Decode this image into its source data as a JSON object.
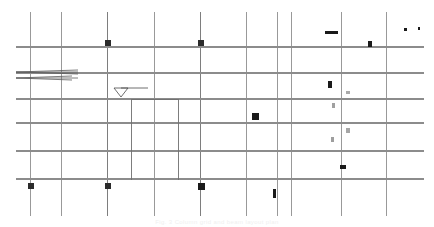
{
  "drawing": {
    "title": "Structural Framing Plan",
    "caption": "Fig. 3  Column grid and beam layout plan",
    "background_color": "#ffffff",
    "grid_line_color": "#9a9a9a",
    "beam_line_color": "#8c8c8c",
    "marker_color": "#1a1a1a",
    "faint_marker_color": "#a8a8a8",
    "annotation_color": "#4a4a4a",
    "caption_color": "#efefef",
    "canvas": {
      "width": 434,
      "height": 227
    }
  },
  "grid": {
    "vertical_label": "Column grid lines (vertical)",
    "horizontal_label": "Beam grid lines (horizontal)",
    "vertical_lines": [
      {
        "id": "V1",
        "x": 30,
        "y1": 12,
        "y2": 216,
        "weight": 0.9,
        "color": "#8e8e8e"
      },
      {
        "id": "V2",
        "x": 61,
        "y1": 12,
        "y2": 216,
        "weight": 0.9,
        "color": "#8e8e8e"
      },
      {
        "id": "V3",
        "x": 107,
        "y1": 12,
        "y2": 216,
        "weight": 1.0,
        "color": "#7e7e7e"
      },
      {
        "id": "V4",
        "x": 154,
        "y1": 12,
        "y2": 216,
        "weight": 0.9,
        "color": "#8e8e8e"
      },
      {
        "id": "V5",
        "x": 200,
        "y1": 12,
        "y2": 216,
        "weight": 1.0,
        "color": "#7e7e7e"
      },
      {
        "id": "V6",
        "x": 246,
        "y1": 12,
        "y2": 216,
        "weight": 0.9,
        "color": "#8e8e8e"
      },
      {
        "id": "V7",
        "x": 277,
        "y1": 12,
        "y2": 216,
        "weight": 0.9,
        "color": "#8e8e8e"
      },
      {
        "id": "V8",
        "x": 291,
        "y1": 12,
        "y2": 216,
        "weight": 0.9,
        "color": "#8e8e8e"
      },
      {
        "id": "V9",
        "x": 341,
        "y1": 12,
        "y2": 216,
        "weight": 0.9,
        "color": "#8e8e8e"
      },
      {
        "id": "V10",
        "x": 386,
        "y1": 12,
        "y2": 216,
        "weight": 0.9,
        "color": "#8e8e8e"
      }
    ],
    "horizontal_lines": [
      {
        "id": "H1",
        "y": 47,
        "x1": 16,
        "x2": 424,
        "weight": 1.1,
        "color": "#8c8c8c"
      },
      {
        "id": "H2",
        "y": 73,
        "x1": 16,
        "x2": 424,
        "weight": 1.1,
        "color": "#8c8c8c"
      },
      {
        "id": "H3",
        "y": 99,
        "x1": 16,
        "x2": 424,
        "weight": 1.1,
        "color": "#8c8c8c"
      },
      {
        "id": "H4",
        "y": 123,
        "x1": 16,
        "x2": 424,
        "weight": 1.1,
        "color": "#8c8c8c"
      },
      {
        "id": "H5",
        "y": 151,
        "x1": 16,
        "x2": 424,
        "weight": 1.1,
        "color": "#8c8c8c"
      },
      {
        "id": "H6",
        "y": 179,
        "x1": 16,
        "x2": 424,
        "weight": 1.3,
        "color": "#8c8c8c"
      }
    ],
    "interior_lines": [
      {
        "id": "I1",
        "x": 131,
        "y1": 100,
        "y2": 180,
        "weight": 0.9,
        "color": "#6f6f6f"
      },
      {
        "id": "I2",
        "x": 178,
        "y1": 99,
        "y2": 180,
        "weight": 0.9,
        "color": "#6f6f6f"
      },
      {
        "id": "I3",
        "y": 99,
        "x1": 131,
        "x2": 178,
        "weight": 0.9,
        "color": "#6f6f6f"
      }
    ]
  },
  "markers": {
    "label": "Column / detail markers",
    "squares": [
      {
        "id": "M1",
        "x": 105,
        "y": 40,
        "w": 6,
        "h": 6,
        "fill": "#2b2b2b",
        "kind": "column-marker"
      },
      {
        "id": "M2",
        "x": 198,
        "y": 40,
        "w": 6,
        "h": 6,
        "fill": "#2b2b2b",
        "kind": "column-marker"
      },
      {
        "id": "M3",
        "x": 368,
        "y": 41,
        "w": 4,
        "h": 6,
        "fill": "#1a1a1a",
        "kind": "detail-tag"
      },
      {
        "id": "M4",
        "x": 404,
        "y": 28,
        "w": 3,
        "h": 3,
        "fill": "#1a1a1a",
        "kind": "detail-tag"
      },
      {
        "id": "M5",
        "x": 418,
        "y": 27,
        "w": 2,
        "h": 3,
        "fill": "#1a1a1a",
        "kind": "detail-tag"
      },
      {
        "id": "M6",
        "x": 328,
        "y": 81,
        "w": 4,
        "h": 7,
        "fill": "#1a1a1a",
        "kind": "detail-tag"
      },
      {
        "id": "M7",
        "x": 346,
        "y": 91,
        "w": 4,
        "h": 3,
        "fill": "#aaaaaa",
        "kind": "faint-tag"
      },
      {
        "id": "M8",
        "x": 332,
        "y": 103,
        "w": 3,
        "h": 5,
        "fill": "#a0a0a0",
        "kind": "faint-tag"
      },
      {
        "id": "M9",
        "x": 252,
        "y": 113,
        "w": 7,
        "h": 7,
        "fill": "#1a1a1a",
        "kind": "column-marker"
      },
      {
        "id": "M10",
        "x": 346,
        "y": 128,
        "w": 4,
        "h": 5,
        "fill": "#a6a6a6",
        "kind": "faint-tag"
      },
      {
        "id": "M11",
        "x": 331,
        "y": 137,
        "w": 3,
        "h": 5,
        "fill": "#9e9e9e",
        "kind": "faint-tag"
      },
      {
        "id": "M12",
        "x": 340,
        "y": 165,
        "w": 6,
        "h": 4,
        "fill": "#1a1a1a",
        "kind": "detail-tag"
      },
      {
        "id": "M13",
        "x": 28,
        "y": 183,
        "w": 6,
        "h": 6,
        "fill": "#2b2b2b",
        "kind": "column-marker"
      },
      {
        "id": "M14",
        "x": 105,
        "y": 183,
        "w": 6,
        "h": 6,
        "fill": "#2b2b2b",
        "kind": "column-marker"
      },
      {
        "id": "M15",
        "x": 198,
        "y": 183,
        "w": 7,
        "h": 7,
        "fill": "#1a1a1a",
        "kind": "column-marker"
      },
      {
        "id": "M16",
        "x": 273,
        "y": 189,
        "w": 3,
        "h": 9,
        "fill": "#1a1a1a",
        "kind": "detail-tag"
      },
      {
        "id": "M17",
        "x": 325,
        "y": 31,
        "w": 13,
        "h": 3,
        "fill": "#1a1a1a",
        "kind": "section-bar"
      }
    ]
  },
  "annotations": {
    "leader_arrow": {
      "name": "Leader arrow annotation",
      "tip_x": 16,
      "tip_y": 72,
      "tail_x": 62,
      "tail_y": 72,
      "color": "#5a5a5a"
    },
    "elevation_marker": {
      "name": "Elevation level triangle",
      "x": 114,
      "y": 88,
      "width": 14,
      "height": 9,
      "line_length": 34,
      "color": "#4a4a4a"
    }
  }
}
